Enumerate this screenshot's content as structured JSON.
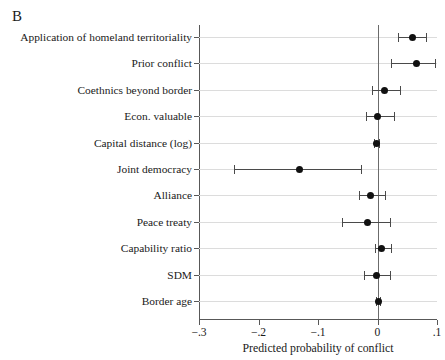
{
  "panel": {
    "letter": "B"
  },
  "chart_data": {
    "type": "scatter",
    "orientation": "horizontal",
    "title": "B",
    "xlabel": "Predicted probability of conflict",
    "ylabel": "",
    "xlim": [
      -0.3,
      0.1
    ],
    "xticks": [
      -0.3,
      -0.2,
      -0.1,
      0,
      0.1
    ],
    "xticklabels": [
      "−.3",
      "−.2",
      "−.1",
      "0",
      ".1"
    ],
    "grid": "horizontal",
    "legend": "none",
    "reference_line": 0,
    "categories": [
      "Application of homeland territoriality",
      "Prior conflict",
      "Coethnics beyond border",
      "Econ. valuable",
      "Capital distance (log)",
      "Joint democracy",
      "Alliance",
      "Peace treaty",
      "Capability ratio",
      "SDM",
      "Border age"
    ],
    "values": [
      0.058,
      0.065,
      0.012,
      0.0,
      -0.002,
      -0.131,
      -0.012,
      -0.017,
      0.006,
      -0.002,
      0.001
    ],
    "ci_low": [
      0.034,
      0.023,
      -0.01,
      -0.019,
      -0.006,
      -0.242,
      -0.031,
      -0.06,
      -0.004,
      -0.023,
      -0.002
    ],
    "ci_high": [
      0.081,
      0.096,
      0.038,
      0.027,
      0.002,
      -0.027,
      0.013,
      0.021,
      0.023,
      0.021,
      0.004
    ]
  }
}
